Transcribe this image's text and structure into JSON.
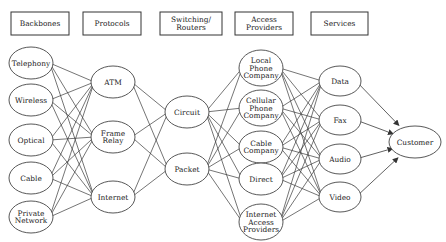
{
  "columns": [
    {
      "id": "backbones",
      "header": [
        "Backbones"
      ],
      "box": {
        "x": 11,
        "y": 12,
        "w": 58,
        "h": 23
      },
      "nodes": [
        {
          "id": "telephony",
          "lines": [
            "Telephony"
          ],
          "cx": 31,
          "cy": 63,
          "rx": 22,
          "ry": 16
        },
        {
          "id": "wireless",
          "lines": [
            "Wireless"
          ],
          "cx": 31,
          "cy": 100,
          "rx": 22,
          "ry": 16
        },
        {
          "id": "optical",
          "lines": [
            "Optical"
          ],
          "cx": 31,
          "cy": 140,
          "rx": 22,
          "ry": 16
        },
        {
          "id": "cable",
          "lines": [
            "Cable"
          ],
          "cx": 31,
          "cy": 178,
          "rx": 22,
          "ry": 16
        },
        {
          "id": "private-network",
          "lines": [
            "Private",
            "Network"
          ],
          "cx": 31,
          "cy": 217,
          "rx": 22,
          "ry": 16
        }
      ]
    },
    {
      "id": "protocols",
      "header": [
        "Protocols"
      ],
      "box": {
        "x": 83,
        "y": 12,
        "w": 58,
        "h": 23
      },
      "nodes": [
        {
          "id": "atm",
          "lines": [
            "ATM"
          ],
          "cx": 113,
          "cy": 82,
          "rx": 22,
          "ry": 16
        },
        {
          "id": "frame-relay",
          "lines": [
            "Frame",
            "Relay"
          ],
          "cx": 113,
          "cy": 137,
          "rx": 22,
          "ry": 16
        },
        {
          "id": "internet",
          "lines": [
            "Internet"
          ],
          "cx": 113,
          "cy": 197,
          "rx": 22,
          "ry": 16
        }
      ]
    },
    {
      "id": "switching",
      "header": [
        "Switching/",
        "Routers"
      ],
      "box": {
        "x": 160,
        "y": 12,
        "w": 62,
        "h": 23
      },
      "nodes": [
        {
          "id": "circuit",
          "lines": [
            "Circuit"
          ],
          "cx": 187,
          "cy": 112,
          "rx": 22,
          "ry": 16
        },
        {
          "id": "packet",
          "lines": [
            "Packet"
          ],
          "cx": 187,
          "cy": 169,
          "rx": 22,
          "ry": 16
        }
      ]
    },
    {
      "id": "access",
      "header": [
        "Access",
        "Providers"
      ],
      "box": {
        "x": 235,
        "y": 12,
        "w": 58,
        "h": 23
      },
      "nodes": [
        {
          "id": "local-phone",
          "lines": [
            "Local",
            "Phone",
            "Company"
          ],
          "cx": 261,
          "cy": 68,
          "rx": 22,
          "ry": 18
        },
        {
          "id": "cellular-phone",
          "lines": [
            "Cellular",
            "Phone",
            "Company"
          ],
          "cx": 261,
          "cy": 108,
          "rx": 22,
          "ry": 18
        },
        {
          "id": "cable-company",
          "lines": [
            "Cable",
            "Company"
          ],
          "cx": 261,
          "cy": 147,
          "rx": 22,
          "ry": 16
        },
        {
          "id": "direct",
          "lines": [
            "Direct"
          ],
          "cx": 261,
          "cy": 179,
          "rx": 22,
          "ry": 16
        },
        {
          "id": "internet-access",
          "lines": [
            "Internet",
            "Access",
            "Providers"
          ],
          "cx": 261,
          "cy": 222,
          "rx": 22,
          "ry": 18
        }
      ]
    },
    {
      "id": "services",
      "header": [
        "Services"
      ],
      "box": {
        "x": 311,
        "y": 12,
        "w": 57,
        "h": 23
      },
      "nodes": [
        {
          "id": "data",
          "lines": [
            "Data"
          ],
          "cx": 340,
          "cy": 81,
          "rx": 21,
          "ry": 15
        },
        {
          "id": "fax",
          "lines": [
            "Fax"
          ],
          "cx": 340,
          "cy": 120,
          "rx": 21,
          "ry": 15
        },
        {
          "id": "audio",
          "lines": [
            "Audio"
          ],
          "cx": 340,
          "cy": 159,
          "rx": 21,
          "ry": 15
        },
        {
          "id": "video",
          "lines": [
            "Video"
          ],
          "cx": 340,
          "cy": 197,
          "rx": 21,
          "ry": 15
        }
      ]
    }
  ],
  "customer": {
    "id": "customer",
    "lines": [
      "Customer"
    ],
    "cx": 415,
    "cy": 142,
    "rx": 26,
    "ry": 16
  },
  "edges": {
    "backbones_to_protocols": "all-to-all",
    "protocols_to_switching": "all-to-all",
    "switching_to_access": "all-to-all",
    "access_to_services": "all-to-all",
    "services_to_customer": "arrows"
  }
}
